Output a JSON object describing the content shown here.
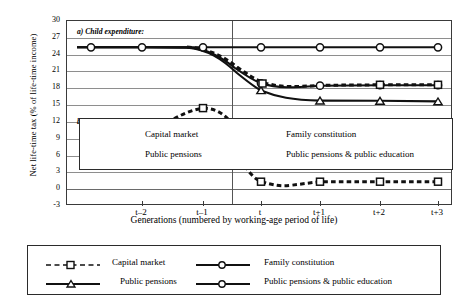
{
  "figure": {
    "ylabel": "Net life-time tax (% of life-time income)",
    "xlabel": "Generations (numbered by working-age period of life)",
    "panel_a_label": "a) Child expenditure:",
    "panel_b_label": "b) Public pensions:"
  },
  "caption_box": {
    "items": [
      "Capital market",
      "Family constitution",
      "Public pensions",
      "Public pensions & public education"
    ]
  },
  "legend": {
    "entries": [
      {
        "label": "Capital market",
        "marker": "square-marker",
        "line": "dashed"
      },
      {
        "label": "Family constitution",
        "marker": "circle-marker",
        "line": "solid"
      },
      {
        "label": "Public pensions",
        "marker": "triangle-marker",
        "line": "solid"
      },
      {
        "label": "Public pensions & public education",
        "marker": "circle-marker",
        "line": "solid"
      }
    ]
  },
  "chart_data": {
    "type": "line",
    "title": "",
    "xlabel": "Generations (numbered by working-age period of life)",
    "ylabel": "Net life-time tax (% of life-time income)",
    "categories": [
      "t-2",
      "t-1",
      "t",
      "t+1",
      "t+2",
      "t+3"
    ],
    "yticks": [
      30,
      27,
      24,
      21,
      18,
      15,
      12,
      9,
      6,
      3,
      0,
      -3
    ],
    "ylim": [
      -3,
      30
    ],
    "grid": true,
    "legend_position": "below-axes",
    "annotations": [
      {
        "text": "a) Child expenditure:",
        "x": "t-2.6",
        "y": 28.5
      },
      {
        "text": "b) Public pensions:",
        "x": "t-2.6",
        "y": 12.8
      },
      {
        "text": "vertical reference line just left of generation t"
      }
    ],
    "panels": [
      {
        "name": "a) Child expenditure:",
        "series": [
          {
            "name": "Capital market",
            "marker": "square",
            "line": "dashed",
            "values": [
              25.3,
              25.3,
              20.0,
              20.2,
              20.3,
              20.3
            ]
          },
          {
            "name": "Family constitution",
            "marker": "circle",
            "line": "solid",
            "values": [
              25.3,
              25.3,
              25.3,
              25.3,
              25.3,
              25.3
            ]
          },
          {
            "name": "Public pensions",
            "marker": "triangle",
            "line": "solid",
            "values": [
              25.3,
              25.3,
              18.0,
              17.3,
              17.3,
              17.2
            ]
          },
          {
            "name": "Public pensions & public education",
            "marker": "circle",
            "line": "solid",
            "values": [
              25.3,
              25.3,
              19.9,
              20.2,
              20.3,
              20.3
            ]
          }
        ]
      },
      {
        "name": "b) Public pensions:",
        "series": [
          {
            "name": "Capital market",
            "marker": "square",
            "line": "dashed",
            "values": [
              null,
              15.0,
              0.0,
              0.0,
              0.0,
              0.0
            ],
            "note": "rises to a hump of 15 at t-1, falls steeply through t, dips to about -0.9 between t and t+1, then returns to 0"
          }
        ]
      }
    ]
  }
}
